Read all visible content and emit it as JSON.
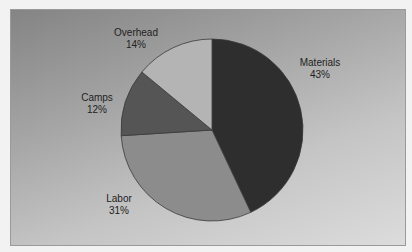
{
  "chart_data": {
    "type": "pie",
    "title": "",
    "categories": [
      "Materials",
      "Labor",
      "Camps",
      "Overhead"
    ],
    "values": [
      43,
      31,
      12,
      14
    ],
    "unit": "%",
    "start_angle": "12 o'clock",
    "direction": "clockwise",
    "legend": "none (data labels beside slices)",
    "slices": [
      {
        "name": "Materials",
        "value": 43,
        "label": "43%",
        "color": "#2e2e2e"
      },
      {
        "name": "Labor",
        "value": 31,
        "label": "31%",
        "color": "#8c8c8c"
      },
      {
        "name": "Camps",
        "value": 12,
        "label": "12%",
        "color": "#555555"
      },
      {
        "name": "Overhead",
        "value": 14,
        "label": "14%",
        "color": "#b4b4b4"
      }
    ]
  },
  "labels": {
    "materials": {
      "name": "Materials",
      "pct": "43%"
    },
    "labor": {
      "name": "Labor",
      "pct": "31%"
    },
    "camps": {
      "name": "Camps",
      "pct": "12%"
    },
    "overhead": {
      "name": "Overhead",
      "pct": "14%"
    }
  },
  "colors": {
    "background_top": "#848484",
    "background_bottom": "#dcdcdc",
    "slice_outline": "#3a3a3a",
    "text": "#222222"
  }
}
